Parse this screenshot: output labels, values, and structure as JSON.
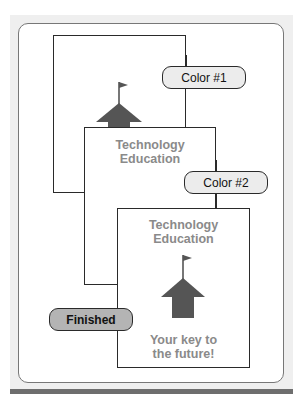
{
  "diagram": {
    "steps": [
      {
        "label": "Color #1"
      },
      {
        "label": "Color #2"
      },
      {
        "label": "Finished"
      }
    ],
    "pages": [
      {
        "name": "page-1",
        "content": []
      },
      {
        "name": "page-2",
        "title_line1": "Technology",
        "title_line2": "Education"
      },
      {
        "name": "page-3",
        "title_line1": "Technology",
        "title_line2": "Education",
        "tagline_line1": "Your key to",
        "tagline_line2": "the future!"
      }
    ],
    "icons": [
      "schoolhouse-icon",
      "flag-icon"
    ],
    "colors": {
      "ink": "#2a2a2a",
      "text_gray": "#8a8a8a",
      "house": "#555555",
      "pill_fill": "#ececec",
      "finished_fill": "#b4b4b4",
      "background": "#efefef"
    }
  }
}
